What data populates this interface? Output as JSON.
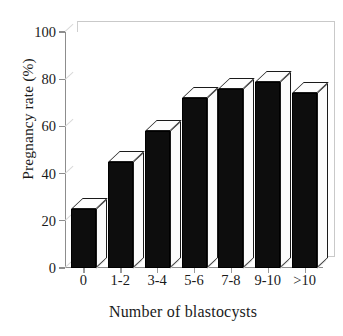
{
  "chart_data": {
    "type": "bar",
    "title": "",
    "xlabel": "Number of blastocysts",
    "ylabel": "Pregnancy rate (%)",
    "categories": [
      "0",
      "1-2",
      "3-4",
      "5-6",
      "7-8",
      "9-10",
      ">10"
    ],
    "values": [
      25,
      45,
      58,
      72,
      76,
      79,
      74
    ],
    "ylim": [
      0,
      100
    ],
    "yticks": [
      0,
      20,
      40,
      60,
      80,
      100
    ],
    "ytick_labels": [
      "0",
      "20",
      "40",
      "60",
      "80",
      "100"
    ],
    "grid": false,
    "legend": "none",
    "style": "3d-bar",
    "bar_color": "#0d0d0d",
    "bar_highlight_color": "#fdfdfd",
    "axis_color": "#8d8d8d",
    "background": "#ffffff"
  }
}
